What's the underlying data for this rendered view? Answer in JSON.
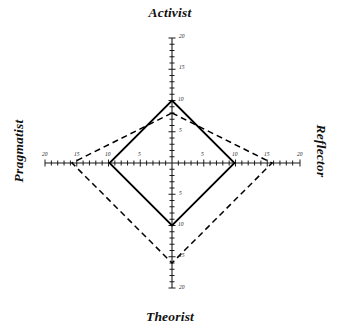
{
  "chart_data": {
    "type": "radar",
    "title": "",
    "subtitle": "",
    "xlabel": "",
    "ylabel": "",
    "grid": false,
    "legend_position": "none",
    "axes": [
      {
        "name": "Activist",
        "direction": "up",
        "min": 0,
        "max": 20,
        "ticks": [
          5,
          10,
          15,
          20
        ]
      },
      {
        "name": "Reflector",
        "direction": "right",
        "min": 0,
        "max": 20,
        "ticks": [
          5,
          10,
          15,
          20
        ]
      },
      {
        "name": "Theorist",
        "direction": "down",
        "min": 0,
        "max": 20,
        "ticks": [
          5,
          10,
          15,
          20
        ]
      },
      {
        "name": "Pragmatist",
        "direction": "left",
        "min": 0,
        "max": 20,
        "ticks": [
          5,
          10,
          15,
          20
        ]
      }
    ],
    "categories": [
      "Activist",
      "Reflector",
      "Theorist",
      "Pragmatist"
    ],
    "series": [
      {
        "name": "solid",
        "line_style": "solid",
        "color": "#000000",
        "values": [
          10,
          10,
          10,
          10
        ]
      },
      {
        "name": "dashed",
        "line_style": "dashed",
        "color": "#000000",
        "values": [
          8,
          16,
          16,
          16
        ]
      }
    ],
    "tick_labels": {
      "activist": [
        {
          "value": 20,
          "text": "20"
        },
        {
          "value": 15,
          "text": "15"
        },
        {
          "value": 10,
          "text": "10"
        },
        {
          "value": 5,
          "text": "5"
        }
      ],
      "reflector": [
        {
          "value": 20,
          "text": "20"
        },
        {
          "value": 15,
          "text": "15"
        },
        {
          "value": 10,
          "text": "10"
        },
        {
          "value": 5,
          "text": "5"
        }
      ],
      "theorist": [
        {
          "value": 20,
          "text": "20"
        },
        {
          "value": 15,
          "text": "15"
        },
        {
          "value": 10,
          "text": "10"
        },
        {
          "value": 5,
          "text": "5"
        }
      ],
      "pragmatist": [
        {
          "value": 20,
          "text": "20"
        },
        {
          "value": 15,
          "text": "15"
        },
        {
          "value": 10,
          "text": "10"
        },
        {
          "value": 5,
          "text": "5"
        }
      ]
    }
  },
  "labels": {
    "activist": "Activist",
    "reflector": "Reflector",
    "theorist": "Theorist",
    "pragmatist": "Pragmatist"
  },
  "ticks": {
    "activist_20": "20",
    "activist_15": "15",
    "activist_10": "10",
    "activist_5": "5",
    "reflector_20": "20",
    "reflector_15": "15",
    "reflector_10": "10",
    "reflector_5": "5",
    "theorist_20": "20",
    "theorist_15": "15",
    "theorist_10": "10",
    "theorist_5": "5",
    "pragmatist_20": "20",
    "pragmatist_15": "15",
    "pragmatist_10": "10",
    "pragmatist_5": "5"
  },
  "colors": {
    "axis": "#1a1a1a",
    "solid_series": "#000000",
    "dashed_series": "#000000",
    "background": "#ffffff"
  }
}
